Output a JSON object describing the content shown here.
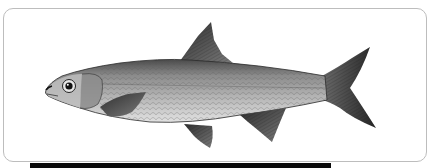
{
  "image": {
    "subject": "fish illustration",
    "description": "Grayscale scientific illustration of a silvery freshwater fish facing left, showing dorsal, pectoral, pelvic, anal and forked caudal fins",
    "style": "monochrome engraving"
  },
  "colors": {
    "background": "#ffffff",
    "card_border": "#bdbdbd",
    "bottom_bar": "#0a0a0a",
    "fin_dark": "#3a3a3a",
    "body_mid": "#9a9a9a",
    "belly_light": "#d8d8d8"
  }
}
